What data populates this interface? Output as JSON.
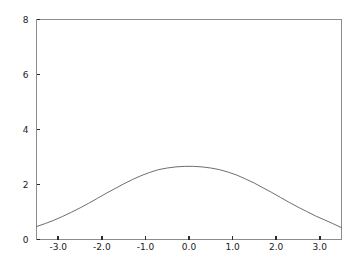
{
  "chart_data": {
    "type": "line",
    "title": "",
    "subtitle": "",
    "xlabel": "",
    "ylabel": "",
    "xlim": [
      -3.5,
      3.5
    ],
    "ylim": [
      0,
      8
    ],
    "grid": false,
    "legend": null,
    "x_ticks": [
      -3.0,
      -2.0,
      -1.0,
      0.0,
      1.0,
      2.0,
      3.0
    ],
    "x_tick_labels": [
      "-3.0",
      "-2.0",
      "-1.0",
      "0.0",
      "1.0",
      "2.0",
      "3.0"
    ],
    "y_ticks": [
      0,
      2,
      4,
      6,
      8
    ],
    "y_tick_labels": [
      "0",
      "2",
      "4",
      "6",
      "8"
    ],
    "series": [
      {
        "name": "curve",
        "color": "#6e6e6e",
        "x": [
          -3.5,
          -3.3,
          -3.1,
          -2.9,
          -2.7,
          -2.5,
          -2.3,
          -2.1,
          -1.9,
          -1.7,
          -1.5,
          -1.3,
          -1.1,
          -0.9,
          -0.7,
          -0.5,
          -0.3,
          -0.1,
          0.1,
          0.3,
          0.5,
          0.7,
          0.9,
          1.1,
          1.3,
          1.5,
          1.7,
          1.9,
          2.1,
          2.3,
          2.5,
          2.7,
          2.9,
          3.1,
          3.3,
          3.5
        ],
        "y": [
          0.47,
          0.58,
          0.7,
          0.84,
          0.99,
          1.15,
          1.32,
          1.5,
          1.68,
          1.85,
          2.02,
          2.18,
          2.32,
          2.44,
          2.54,
          2.6,
          2.64,
          2.66,
          2.66,
          2.64,
          2.6,
          2.54,
          2.45,
          2.34,
          2.2,
          2.05,
          1.88,
          1.71,
          1.53,
          1.35,
          1.18,
          1.02,
          0.86,
          0.72,
          0.58,
          0.43
        ]
      }
    ]
  },
  "footer": {
    "caption": ""
  }
}
